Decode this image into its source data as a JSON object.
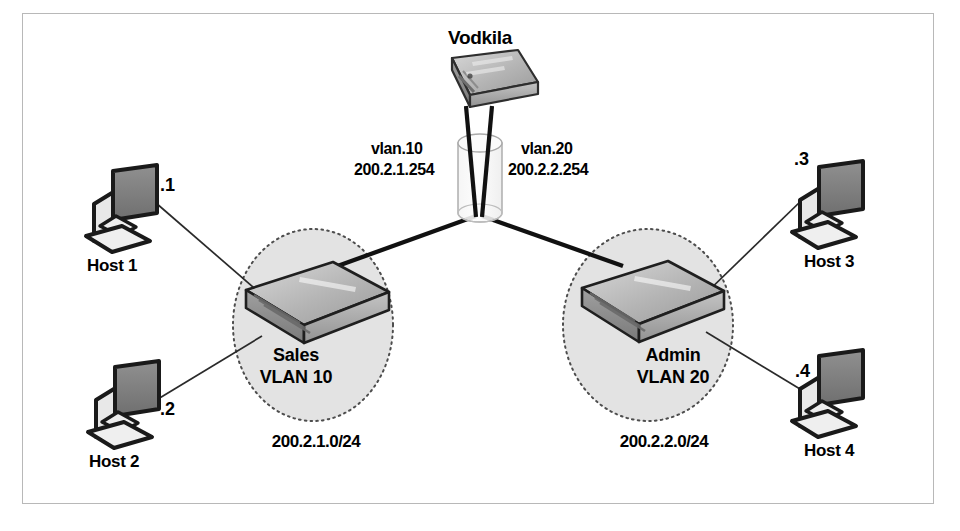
{
  "diagram": {
    "title_node": "Vodkila",
    "router": {
      "name": "Vodkila",
      "device_icon": "router-icon",
      "body_text": "DI-LINK xxx @ RE Master"
    },
    "trunk": {
      "icon": "trunk-cylinder-icon",
      "left": {
        "vlan": "vlan.10",
        "ip": "200.2.1.254"
      },
      "right": {
        "vlan": "vlan.20",
        "ip": "200.2.2.254"
      }
    },
    "vlans": [
      {
        "id": "sales",
        "name": "Sales",
        "vlan_label": "VLAN 10",
        "subnet": "200.2.1.0/24",
        "switch_label": "L2 switch",
        "switch_icon": "switch-icon"
      },
      {
        "id": "admin",
        "name": "Admin",
        "vlan_label": "VLAN 20",
        "subnet": "200.2.2.0/24",
        "switch_label": "L2 switch",
        "switch_icon": "switch-icon"
      }
    ],
    "hosts": [
      {
        "id": "host1",
        "name": "Host 1",
        "ip_suffix": ".1",
        "icon": "computer-icon",
        "vlan": "sales"
      },
      {
        "id": "host2",
        "name": "Host 2",
        "ip_suffix": ".2",
        "icon": "computer-icon",
        "vlan": "sales"
      },
      {
        "id": "host3",
        "name": "Host 3",
        "ip_suffix": ".3",
        "icon": "computer-icon",
        "vlan": "admin"
      },
      {
        "id": "host4",
        "name": "Host 4",
        "ip_suffix": ".4",
        "icon": "computer-icon",
        "vlan": "admin"
      }
    ],
    "colors": {
      "line": "#1a1a1a",
      "vlan_fill": "#e3e3e3",
      "vlan_border": "#4d4d4d",
      "frame": "#b8b8b8",
      "device_dark": "#7d7d7d",
      "device_light": "#c9c9c9",
      "screen": "#8a8a8a"
    }
  }
}
